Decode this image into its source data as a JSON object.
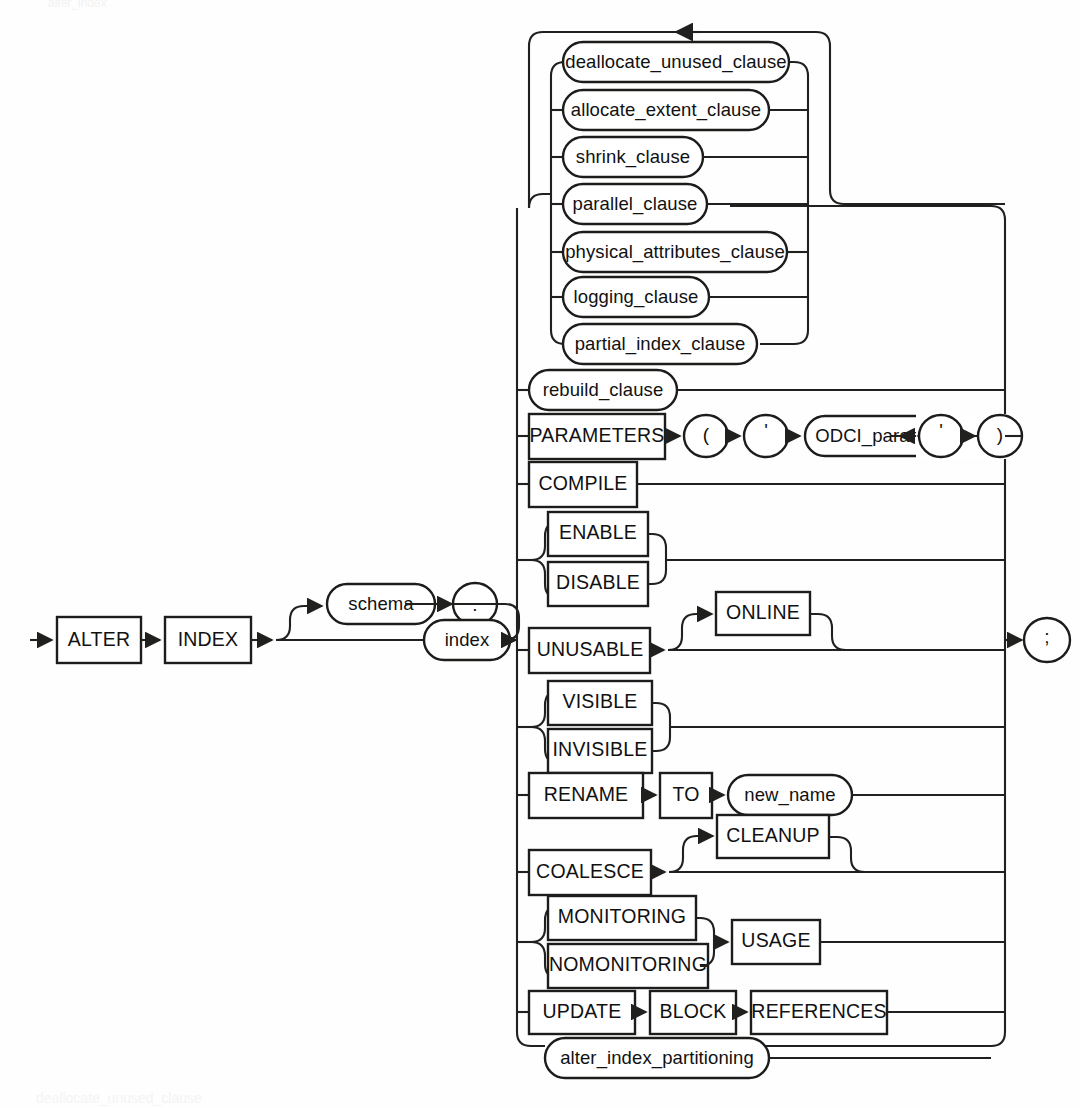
{
  "page": {
    "title": "alter_index",
    "footer": "deallocate_unused_clause",
    "bg_color": "#fefefe",
    "ink_color": "#1c1c1a"
  },
  "diagram": {
    "type": "railroad-syntax-diagram",
    "statement": "ALTER INDEX",
    "head": {
      "keywords": [
        {
          "label": "ALTER",
          "kind": "keyword"
        },
        {
          "label": "INDEX",
          "kind": "keyword"
        }
      ],
      "optional_schema": {
        "label": "schema",
        "kind": "nonterminal"
      },
      "dot": {
        "label": ".",
        "kind": "punctuation"
      },
      "index": {
        "label": "index",
        "kind": "nonterminal"
      }
    },
    "terminator": {
      "label": ";",
      "kind": "punctuation"
    },
    "repeat_group": {
      "loop": true,
      "items": [
        {
          "label": "deallocate_unused_clause",
          "kind": "nonterminal"
        },
        {
          "label": "allocate_extent_clause",
          "kind": "nonterminal"
        },
        {
          "label": "shrink_clause",
          "kind": "nonterminal"
        },
        {
          "label": "parallel_clause",
          "kind": "nonterminal"
        },
        {
          "label": "physical_attributes_clause",
          "kind": "nonterminal"
        },
        {
          "label": "logging_clause",
          "kind": "nonterminal"
        },
        {
          "label": "partial_index_clause",
          "kind": "nonterminal"
        }
      ]
    },
    "alternatives": [
      {
        "id": "rebuild",
        "items": [
          {
            "label": "rebuild_clause",
            "kind": "nonterminal"
          }
        ]
      },
      {
        "id": "parameters",
        "items": [
          {
            "label": "PARAMETERS",
            "kind": "keyword"
          },
          {
            "label": "(",
            "kind": "punctuation"
          },
          {
            "label": "'",
            "kind": "punctuation"
          },
          {
            "label": "ODCI_parameters",
            "kind": "nonterminal"
          },
          {
            "label": "'",
            "kind": "punctuation"
          },
          {
            "label": ")",
            "kind": "punctuation"
          }
        ]
      },
      {
        "id": "compile",
        "items": [
          {
            "label": "COMPILE",
            "kind": "keyword"
          }
        ]
      },
      {
        "id": "enable-disable",
        "choice": [
          {
            "label": "ENABLE",
            "kind": "keyword"
          },
          {
            "label": "DISABLE",
            "kind": "keyword"
          }
        ]
      },
      {
        "id": "unusable",
        "items": [
          {
            "label": "UNUSABLE",
            "kind": "keyword"
          }
        ],
        "optional": {
          "label": "ONLINE",
          "kind": "keyword"
        }
      },
      {
        "id": "visible-invisible",
        "choice": [
          {
            "label": "VISIBLE",
            "kind": "keyword"
          },
          {
            "label": "INVISIBLE",
            "kind": "keyword"
          }
        ]
      },
      {
        "id": "rename",
        "items": [
          {
            "label": "RENAME",
            "kind": "keyword"
          },
          {
            "label": "TO",
            "kind": "keyword"
          },
          {
            "label": "new_name",
            "kind": "nonterminal"
          }
        ]
      },
      {
        "id": "coalesce",
        "items": [
          {
            "label": "COALESCE",
            "kind": "keyword"
          }
        ],
        "optional": {
          "label": "CLEANUP",
          "kind": "keyword"
        }
      },
      {
        "id": "monitoring",
        "choice": [
          {
            "label": "MONITORING",
            "kind": "keyword"
          },
          {
            "label": "NOMONITORING",
            "kind": "keyword"
          }
        ],
        "then": {
          "label": "USAGE",
          "kind": "keyword"
        }
      },
      {
        "id": "update-block-references",
        "items": [
          {
            "label": "UPDATE",
            "kind": "keyword"
          },
          {
            "label": "BLOCK",
            "kind": "keyword"
          },
          {
            "label": "REFERENCES",
            "kind": "keyword"
          }
        ]
      },
      {
        "id": "alter-index-partitioning",
        "items": [
          {
            "label": "alter_index_partitioning",
            "kind": "nonterminal"
          }
        ]
      }
    ]
  }
}
